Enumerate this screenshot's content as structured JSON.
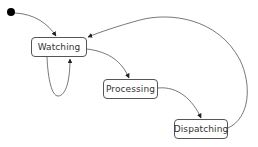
{
  "diagram": {
    "type": "state-machine",
    "initial_state": "Watching",
    "states": [
      {
        "id": "watching",
        "label": "Watching"
      },
      {
        "id": "processing",
        "label": "Processing"
      },
      {
        "id": "dispatching",
        "label": "Dispatching"
      }
    ],
    "transitions": [
      {
        "from": "initial",
        "to": "Watching"
      },
      {
        "from": "Watching",
        "to": "Watching"
      },
      {
        "from": "Watching",
        "to": "Processing"
      },
      {
        "from": "Processing",
        "to": "Dispatching"
      },
      {
        "from": "Dispatching",
        "to": "Watching"
      }
    ],
    "colors": {
      "stroke": "#555555",
      "text": "#333333",
      "background": "#ffffff",
      "initial_dot": "#000000"
    }
  }
}
